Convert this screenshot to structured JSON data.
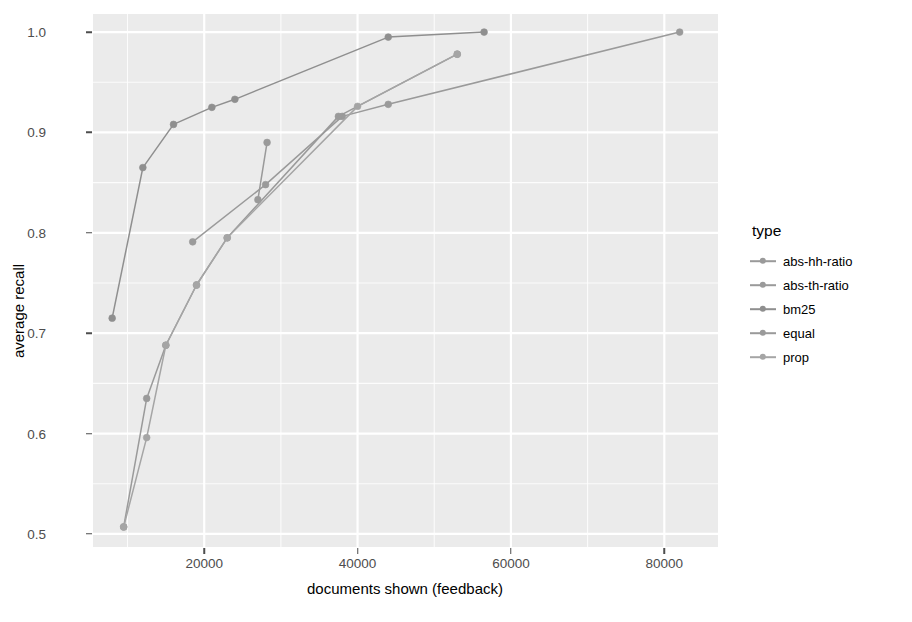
{
  "chart_data": {
    "type": "line",
    "title": "",
    "xlabel": "documents shown (feedback)",
    "ylabel": "average recall",
    "xlim": [
      5500,
      87000
    ],
    "ylim": [
      0.487,
      1.018
    ],
    "xticks": [
      20000,
      40000,
      60000,
      80000
    ],
    "xtick_labels": [
      "20000",
      "40000",
      "60000",
      "80000"
    ],
    "yticks": [
      0.5,
      0.6,
      0.7,
      0.8,
      0.9,
      1.0
    ],
    "ytick_labels": [
      "0.5",
      "0.6",
      "0.7",
      "0.8",
      "0.9",
      "1.0"
    ],
    "grid": true,
    "grid_color": "#ffffff",
    "panel_background": "#ebebeb",
    "legend": {
      "title": "type",
      "position": "right",
      "entries": [
        "abs-hh-ratio",
        "abs-th-ratio",
        "bm25",
        "equal",
        "prop"
      ]
    },
    "series": [
      {
        "name": "abs-hh-ratio",
        "color": "#9a9a9a",
        "x": [
          18500,
          28000,
          38000,
          44000,
          82000
        ],
        "y": [
          0.791,
          0.848,
          0.916,
          0.928,
          1.0
        ]
      },
      {
        "name": "abs-th-ratio",
        "color": "#9a9a9a",
        "x": [
          27000,
          28200
        ],
        "y": [
          0.833,
          0.89
        ]
      },
      {
        "name": "bm25",
        "color": "#8f8f8f",
        "x": [
          8000,
          12000,
          16000,
          21000,
          24000,
          44000,
          56500
        ],
        "y": [
          0.715,
          0.865,
          0.908,
          0.925,
          0.933,
          0.995,
          1.0
        ]
      },
      {
        "name": "equal",
        "color": "#9a9a9a",
        "x": [
          9500,
          12500,
          15000,
          19000,
          23000,
          37500,
          53000
        ],
        "y": [
          0.507,
          0.635,
          0.688,
          0.748,
          0.795,
          0.916,
          0.978
        ]
      },
      {
        "name": "prop",
        "color": "#a5a5a5",
        "x": [
          9500,
          12500,
          15000,
          19000,
          23000,
          40000,
          53000
        ],
        "y": [
          0.507,
          0.596,
          0.688,
          0.748,
          0.795,
          0.926,
          0.978
        ]
      }
    ]
  }
}
